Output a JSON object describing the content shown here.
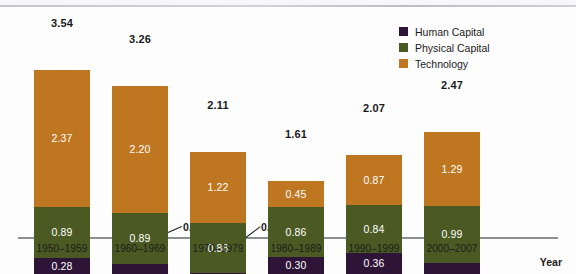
{
  "chart_data": {
    "type": "bar",
    "stacked": true,
    "title": "",
    "xlabel": "Year",
    "ylabel": "",
    "grid": false,
    "legend_position": "top-right",
    "ylim": [
      0,
      3.54
    ],
    "categories": [
      "1950–1959",
      "1960–1969",
      "1970–1979",
      "1980–1989",
      "1990–1999",
      "2000–2007"
    ],
    "series": [
      {
        "name": "Human Capital",
        "color": "#2e1437",
        "values": [
          0.28,
          0.17,
          0.01,
          0.3,
          0.36,
          0.19
        ]
      },
      {
        "name": "Physical Capital",
        "color": "#4b5a23",
        "values": [
          0.89,
          0.89,
          0.88,
          0.86,
          0.84,
          0.99
        ]
      },
      {
        "name": "Technology",
        "color": "#bf7621",
        "values": [
          2.37,
          2.2,
          1.22,
          0.45,
          0.87,
          1.29
        ]
      }
    ],
    "totals": [
      3.54,
      3.26,
      2.11,
      1.61,
      2.07,
      2.47
    ],
    "total_labels": [
      "3.54",
      "3.26",
      "2.11",
      "1.61",
      "2.07",
      "2.47"
    ],
    "segment_labels": {
      "human_capital": [
        "0.28",
        "0.17",
        "0.01",
        "0.30",
        "0.36",
        "0.19"
      ],
      "physical_capital": [
        "0.89",
        "0.89",
        "0.88",
        "0.86",
        "0.84",
        "0.99"
      ],
      "technology": [
        "2.37",
        "2.20",
        "1.22",
        "0.45",
        "0.87",
        "1.29"
      ]
    },
    "callouts": [
      {
        "category": "1960–1969",
        "series": "Human Capital",
        "value": "0.17"
      },
      {
        "category": "1970–1979",
        "series": "Human Capital",
        "value": "0.01"
      }
    ]
  },
  "legend": {
    "items": [
      {
        "label": "Human Capital",
        "color": "#2e1437"
      },
      {
        "label": "Physical Capital",
        "color": "#4b5a23"
      },
      {
        "label": "Technology",
        "color": "#bf7621"
      }
    ]
  },
  "axis": {
    "x_title": "Year",
    "categories": [
      "1950–1959",
      "1960–1969",
      "1970–1979",
      "1980–1989",
      "1990–1999",
      "2000–2007"
    ]
  }
}
